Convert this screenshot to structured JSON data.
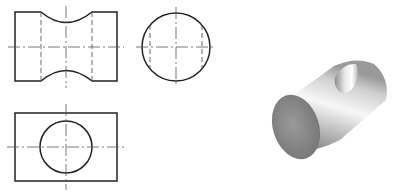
{
  "drawing": {
    "type": "orthographic-projection-with-isometric",
    "views": [
      {
        "name": "front-view",
        "shape": "rectangle-with-curved-neck"
      },
      {
        "name": "side-view",
        "shape": "circle"
      },
      {
        "name": "top-view",
        "shape": "rectangle-with-circle"
      },
      {
        "name": "isometric-view",
        "shape": "cylinder-with-curved-cut"
      }
    ],
    "colors": {
      "line": "#222222",
      "hidden_line": "#555555",
      "background": "#ffffff",
      "shade_light": "#f4f4f4",
      "shade_dark": "#7a7a7a",
      "end_face": "#8a8a8a"
    }
  }
}
